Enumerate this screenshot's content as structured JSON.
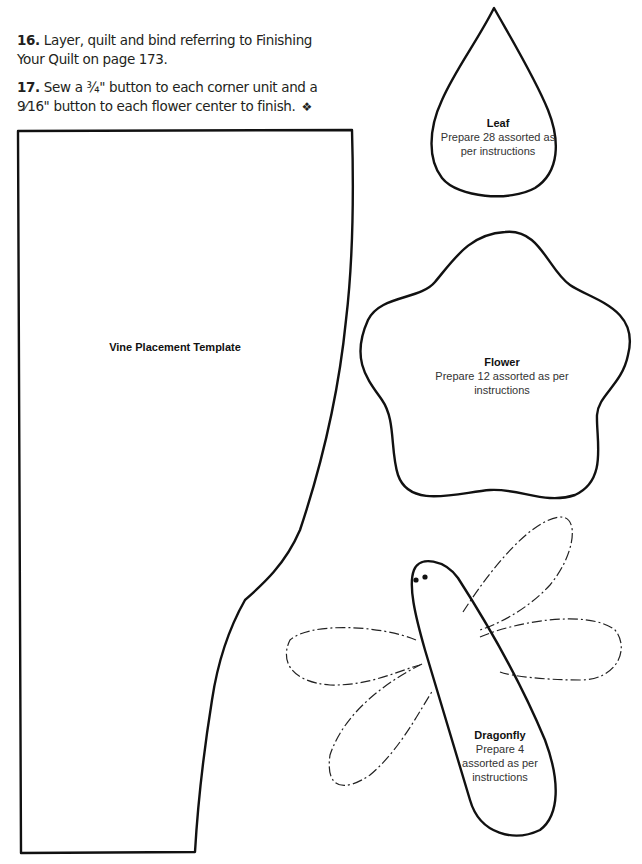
{
  "instructions": {
    "steps": [
      {
        "number": "16.",
        "text": "Layer, quilt and bind referring to Finishing Your Quilt on page 173."
      },
      {
        "number": "17.",
        "text": "Sew a ¾\" button to each corner unit and a 9⁄16\" button to each flower center to finish.",
        "end_mark": "❖"
      }
    ]
  },
  "templates": {
    "vine": {
      "title": "Vine Placement Template"
    },
    "leaf": {
      "title": "Leaf",
      "desc": "Prepare 28 assorted as per instructions"
    },
    "flower": {
      "title": "Flower",
      "desc": "Prepare 12 assorted as per instructions"
    },
    "dragonfly": {
      "title": "Dragonfly",
      "desc": "Prepare 4 assorted as per instructions"
    }
  },
  "colors": {
    "outline": "#111111",
    "text": "#231f20"
  }
}
